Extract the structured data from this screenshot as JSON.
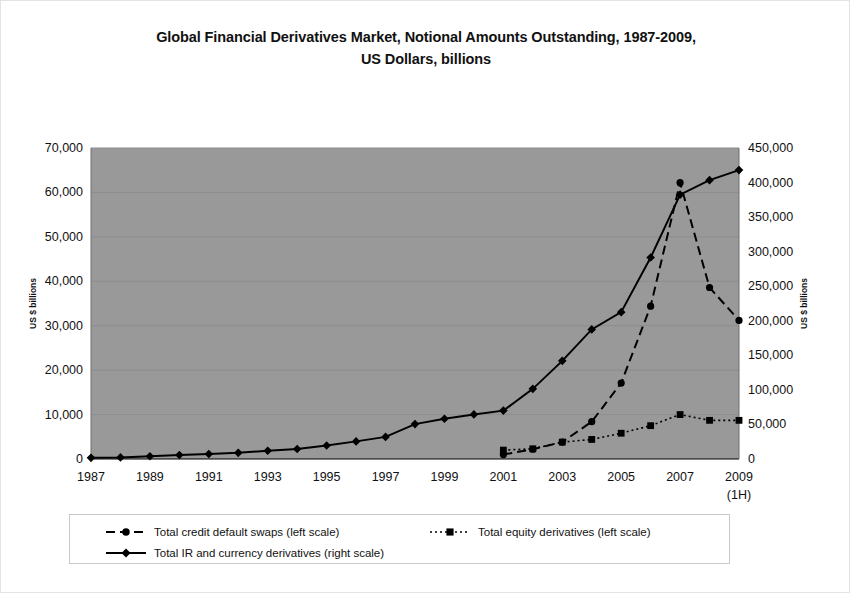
{
  "chart_data": {
    "type": "line",
    "title": "Global Financial Derivatives Market, Notional Amounts Outstanding, 1987-2009,",
    "title_line2": "US Dollars, billions",
    "xlabel": "",
    "ylabel": "US $ billions",
    "ylabel_right": "US $ billions",
    "grid": true,
    "legend_position": "bottom",
    "plot_background": "#999999",
    "series_color": "#000000",
    "x": [
      1987,
      1988,
      1989,
      1990,
      1991,
      1992,
      1993,
      1994,
      1995,
      1996,
      1997,
      1998,
      1999,
      2000,
      2001,
      2002,
      2003,
      2004,
      2005,
      2006,
      2007,
      2008,
      2009
    ],
    "x_tick_labels": [
      "1987",
      "",
      "1989",
      "",
      "1991",
      "",
      "1993",
      "",
      "1995",
      "",
      "1997",
      "",
      "1999",
      "",
      "2001",
      "",
      "2003",
      "",
      "2005",
      "",
      "2007",
      "",
      "2009"
    ],
    "x_last_label_sub": "(1H)",
    "ylim": [
      0,
      70000
    ],
    "y_ticks": [
      0,
      10000,
      20000,
      30000,
      40000,
      50000,
      60000,
      70000
    ],
    "y_tick_labels": [
      "0",
      "10,000",
      "20,000",
      "30,000",
      "40,000",
      "50,000",
      "60,000",
      "70,000"
    ],
    "ylim_right": [
      0,
      450000
    ],
    "y_ticks_right": [
      0,
      50000,
      100000,
      150000,
      200000,
      250000,
      300000,
      350000,
      400000,
      450000
    ],
    "y_tick_labels_right": [
      "0",
      "50,000",
      "100,000",
      "150,000",
      "200,000",
      "250,000",
      "300,000",
      "350,000",
      "400,000",
      "450,000"
    ],
    "series": [
      {
        "name": "Total credit default swaps (left scale)",
        "axis": "left",
        "marker": "circle",
        "dash": "dashed",
        "x": [
          2001,
          2002,
          2003,
          2004,
          2005,
          2006,
          2007,
          2008,
          2009
        ],
        "values": [
          1000,
          2200,
          3800,
          8400,
          17100,
          34400,
          62200,
          38600,
          31200
        ]
      },
      {
        "name": "Total equity derivatives (left scale)",
        "axis": "left",
        "marker": "square",
        "dash": "dotted",
        "x": [
          2001,
          2002,
          2003,
          2004,
          2005,
          2006,
          2007,
          2008,
          2009
        ],
        "values": [
          2000,
          2300,
          3800,
          4400,
          5800,
          7500,
          10000,
          8700,
          8700
        ]
      },
      {
        "name": "Total IR and currency derivatives (right scale)",
        "axis": "right",
        "marker": "diamond",
        "dash": "solid",
        "x": [
          1987,
          1988,
          1989,
          1990,
          1991,
          1992,
          1993,
          1994,
          1995,
          1996,
          1997,
          1998,
          1999,
          2000,
          2001,
          2002,
          2003,
          2004,
          2005,
          2006,
          2007,
          2008,
          2009
        ],
        "values": [
          1700,
          2300,
          4000,
          5800,
          7200,
          8900,
          12000,
          14500,
          19500,
          25500,
          32000,
          50500,
          58300,
          64500,
          70000,
          101500,
          142000,
          187500,
          212500,
          291500,
          382500,
          403500,
          418000
        ]
      }
    ]
  },
  "legend": {
    "items": [
      {
        "label": "Total credit default swaps (left scale)",
        "marker": "circle",
        "dash": "dashed"
      },
      {
        "label": "Total equity derivatives (left scale)",
        "marker": "square",
        "dash": "dotted"
      },
      {
        "label": "Total IR and currency derivatives (right scale)",
        "marker": "diamond",
        "dash": "solid"
      }
    ]
  }
}
